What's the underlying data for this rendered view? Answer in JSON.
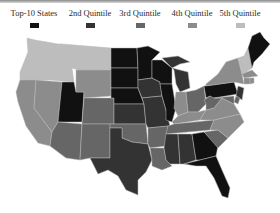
{
  "legend": {
    "items": [
      {
        "label": "Top-10 States",
        "color": "#111111"
      },
      {
        "label": "2nd Quintile",
        "color": "#333333"
      },
      {
        "label": "3rd Quintile",
        "color": "#666666"
      },
      {
        "label": "4th Quintile",
        "color": "#8c8c8c"
      },
      {
        "label": "5th Quintile",
        "color": "#bdbdbd"
      }
    ]
  },
  "map": {
    "type": "choropleth",
    "region": "United States",
    "classes": [
      "Top-10 States",
      "2nd Quintile",
      "3rd Quintile",
      "4th Quintile",
      "5th Quintile"
    ],
    "states": {
      "WA": "5th Quintile",
      "OR": "5th Quintile",
      "ID": "5th Quintile",
      "MT": "5th Quintile",
      "CA": "4th Quintile",
      "NV": "4th Quintile",
      "WY": "4th Quintile",
      "UT": "Top-10 States",
      "CO": "3rd Quintile",
      "AZ": "3rd Quintile",
      "NM": "3rd Quintile",
      "ND": "Top-10 States",
      "SD": "Top-10 States",
      "NE": "Top-10 States",
      "KS": "2nd Quintile",
      "OK": "3rd Quintile",
      "TX": "2nd Quintile",
      "MN": "Top-10 States",
      "IA": "2nd Quintile",
      "MO": "2nd Quintile",
      "AR": "3rd Quintile",
      "LA": "3rd Quintile",
      "WI": "Top-10 States",
      "IL": "Top-10 States",
      "MI": "2nd Quintile",
      "IN": "4th Quintile",
      "OH": "3rd Quintile",
      "KY": "4th Quintile",
      "TN": "3rd Quintile",
      "MS": "2nd Quintile",
      "AL": "2nd Quintile",
      "GA": "Top-10 States",
      "FL": "Top-10 States",
      "SC": "3rd Quintile",
      "NC": "4th Quintile",
      "VA": "4th Quintile",
      "WV": "3rd Quintile",
      "PA": "Top-10 States",
      "NY": "4th Quintile",
      "VT": "5th Quintile",
      "NH": "5th Quintile",
      "ME": "Top-10 States",
      "MA": "4th Quintile",
      "CT": "4th Quintile",
      "RI": "4th Quintile",
      "NJ": "2nd Quintile",
      "DE": "3rd Quintile",
      "MD": "3rd Quintile"
    }
  }
}
